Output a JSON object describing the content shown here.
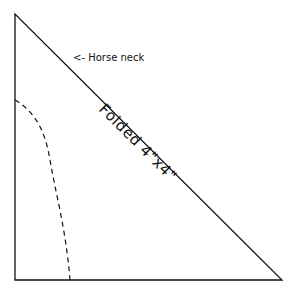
{
  "diagram": {
    "neck_label": "<- Horse neck",
    "fold_label": "Folded 4\"x4\"",
    "line_color": "#111111",
    "background": "#ffffff"
  }
}
